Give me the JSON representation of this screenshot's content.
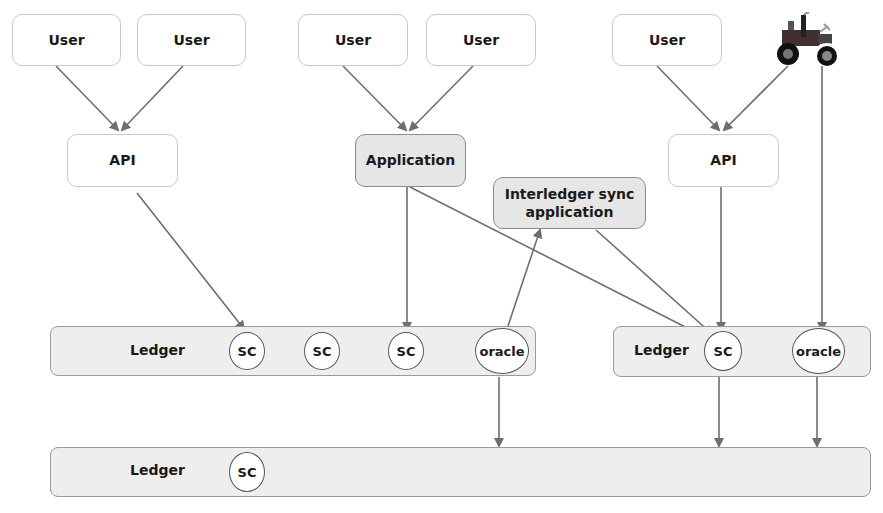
{
  "diagram": {
    "top_row": [
      {
        "label": "User"
      },
      {
        "label": "User"
      },
      {
        "label": "User"
      },
      {
        "label": "User"
      },
      {
        "label": "User"
      },
      {
        "icon": "tractor-icon"
      }
    ],
    "middle": {
      "api_left": "API",
      "application": "Application",
      "api_right": "API",
      "interledger_sync": "Interledger sync application"
    },
    "ledger1": {
      "label": "Ledger",
      "nodes": [
        "SC",
        "SC",
        "SC",
        "oracle"
      ]
    },
    "ledger2": {
      "label": "Ledger",
      "nodes": [
        "SC",
        "oracle"
      ]
    },
    "ledger3": {
      "label": "Ledger",
      "nodes": [
        "SC"
      ]
    },
    "colors": {
      "arrow": "#6e6e6e",
      "gray_box": "#e6e6e6",
      "ledger_fill": "#eeeeee"
    }
  }
}
